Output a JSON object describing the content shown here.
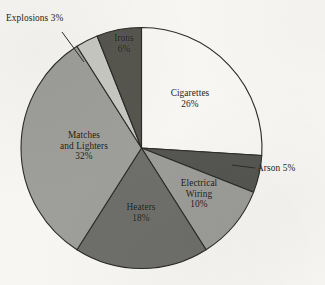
{
  "chart_data": {
    "type": "pie",
    "title": "",
    "subtitle": "",
    "xlabel": "",
    "ylabel": "",
    "legend_position": "none",
    "grid": false,
    "units": "percent",
    "start_angle_deg": 0,
    "direction": "clockwise",
    "categories": [
      "Cigarettes",
      "Arson",
      "Electrical Wiring",
      "Heaters",
      "Matches and Lighters",
      "Explosions",
      "Irons"
    ],
    "values": [
      26,
      5,
      10,
      18,
      32,
      3,
      6
    ],
    "slices": [
      {
        "name": "Cigarettes",
        "value": 26,
        "label_line1": "Cigarettes",
        "label_line2": "26%",
        "color": "#f7f6f2",
        "label_placement": "inside"
      },
      {
        "name": "Arson",
        "value": 5,
        "label_line1": "Arson 5%",
        "label_line2": "",
        "color": "#555552",
        "label_placement": "outside-leader"
      },
      {
        "name": "Electrical Wiring",
        "value": 10,
        "label_line1": "Electrical",
        "label_line2": "Wiring",
        "label_line3": "10%",
        "color": "#9c9c98",
        "label_placement": "inside"
      },
      {
        "name": "Heaters",
        "value": 18,
        "label_line1": "Heaters",
        "label_line2": "18%",
        "color": "#6e6e6a",
        "label_placement": "inside"
      },
      {
        "name": "Matches and Lighters",
        "value": 32,
        "label_line1": "Matches",
        "label_line2": "and Lighters",
        "label_line3": "32%",
        "color": "#9e9e9a",
        "label_placement": "inside"
      },
      {
        "name": "Explosions",
        "value": 3,
        "label_line1": "Explosions 3%",
        "label_line2": "",
        "color": "#c8c8c3",
        "label_placement": "outside-leader"
      },
      {
        "name": "Irons",
        "value": 6,
        "label_line1": "Irons",
        "label_line2": "6%",
        "color": "#56564f",
        "label_placement": "inside"
      }
    ],
    "colors": {
      "background": "#f7f6f2",
      "outline": "#2b2b29",
      "text": "#1d1d1b"
    }
  },
  "labels": {
    "cigarettes": {
      "name": "Cigarettes",
      "value": "26%"
    },
    "arson": {
      "text": "Arson 5%"
    },
    "electrical": {
      "name1": "Electrical",
      "name2": "Wiring",
      "value": "10%"
    },
    "heaters": {
      "name": "Heaters",
      "value": "18%"
    },
    "matches": {
      "name1": "Matches",
      "name2": "and Lighters",
      "value": "32%"
    },
    "explosions": {
      "text": "Explosions 3%"
    },
    "irons": {
      "name": "Irons",
      "value": "6%"
    }
  }
}
